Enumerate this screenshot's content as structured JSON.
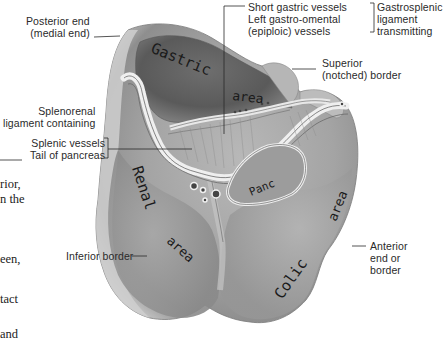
{
  "figure": {
    "labels": {
      "posterior_end": "Posterior end\n(medial end)",
      "short_gastric": "Short gastric vessels\nLeft gastro-omental\n(epiploic) vessels",
      "gastrosplenic": "Gastrosplenic\nligament\ntransmitting",
      "superior_border": "Superior\n(notched) border",
      "splenorenal": "Splenorenal\nligament containing",
      "splenic_vessels": "Splenic vessels\nTail of pancreas",
      "inferior_border": "Inferior border",
      "anterior_end": "Anterior\nend or\nborder"
    },
    "area_labels": {
      "gastric": "Gastric",
      "gastric_area": "area",
      "renal": "Renal",
      "renal_area": "area",
      "colic": "Colic",
      "colic_area": "area",
      "panc": "Panc"
    }
  },
  "body_text_fragments": [
    "rior,",
    "n the",
    "een,",
    "tact",
    "and"
  ]
}
